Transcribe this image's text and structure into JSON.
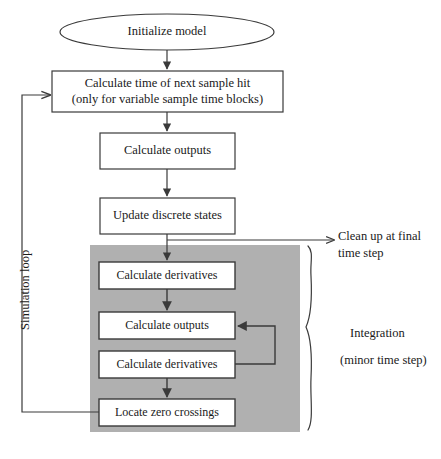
{
  "diagram": {
    "colors": {
      "stroke": "#3a3a3a",
      "box_fill": "#ffffff",
      "region_fill": "#b0b0b0",
      "text": "#1a1a1a"
    },
    "start": {
      "label": "Initialize model",
      "shape": "ellipse"
    },
    "steps": [
      {
        "id": "calc-time-next-sample-hit",
        "label": "Calculate time of next sample hit\n(only for variable sample time blocks)",
        "shape": "rect"
      },
      {
        "id": "calculate-outputs-major",
        "label": "Calculate outputs",
        "shape": "rect"
      },
      {
        "id": "update-discrete-states",
        "label": "Update discrete states",
        "shape": "rect"
      }
    ],
    "integration_region": {
      "label": "Integration\n(minor time step)",
      "annotation_line_1": "Integration",
      "annotation_line_2": "(minor time step)",
      "steps": [
        {
          "id": "calculate-derivatives-1",
          "label": "Calculate derivatives",
          "shape": "rect"
        },
        {
          "id": "calculate-outputs-minor",
          "label": "Calculate outputs",
          "shape": "rect"
        },
        {
          "id": "calculate-derivatives-2",
          "label": "Calculate derivatives",
          "shape": "rect"
        },
        {
          "id": "locate-zero-crossings",
          "label": "Locate zero crossings",
          "shape": "rect"
        }
      ]
    },
    "annotations": [
      {
        "id": "simulation-loop",
        "label": "Simulation loop",
        "orientation": "vertical"
      },
      {
        "id": "clean-up-final-time-step",
        "label": "Clean up at final\ntime step",
        "orientation": "horizontal"
      }
    ]
  }
}
